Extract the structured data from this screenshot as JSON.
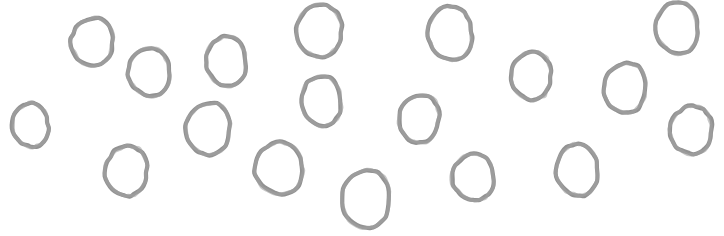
{
  "canvas": {
    "width": 724,
    "height": 236,
    "background_color": "#ffffff",
    "title": "hand-drawn-ellipses-sketch"
  },
  "style": {
    "stroke_color": "#8c8c8c",
    "stroke_color_light": "#a3a3a3",
    "stroke_width": 4.2,
    "fill": "none"
  },
  "shapes": {
    "kind": "ellipse",
    "count": 18,
    "items": [
      {
        "id": "ellipse-1",
        "cx": 32,
        "cy": 125,
        "rx": 18,
        "ry": 22,
        "rot": -8,
        "seed": 11
      },
      {
        "id": "ellipse-2",
        "cx": 94,
        "cy": 42,
        "rx": 21,
        "ry": 24,
        "rot": 6,
        "seed": 23
      },
      {
        "id": "ellipse-3",
        "cx": 151,
        "cy": 72,
        "rx": 21,
        "ry": 24,
        "rot": -5,
        "seed": 37
      },
      {
        "id": "ellipse-4",
        "cx": 128,
        "cy": 171,
        "rx": 21,
        "ry": 25,
        "rot": 4,
        "seed": 41
      },
      {
        "id": "ellipse-5",
        "cx": 228,
        "cy": 61,
        "rx": 20,
        "ry": 25,
        "rot": -3,
        "seed": 53
      },
      {
        "id": "ellipse-6",
        "cx": 210,
        "cy": 129,
        "rx": 22,
        "ry": 26,
        "rot": 7,
        "seed": 67
      },
      {
        "id": "ellipse-7",
        "cx": 281,
        "cy": 168,
        "rx": 24,
        "ry": 26,
        "rot": -10,
        "seed": 71
      },
      {
        "id": "ellipse-8",
        "cx": 321,
        "cy": 31,
        "rx": 23,
        "ry": 26,
        "rot": 5,
        "seed": 83
      },
      {
        "id": "ellipse-9",
        "cx": 323,
        "cy": 101,
        "rx": 20,
        "ry": 25,
        "rot": -4,
        "seed": 97
      },
      {
        "id": "ellipse-10",
        "cx": 368,
        "cy": 199,
        "rx": 24,
        "ry": 29,
        "rot": 3,
        "seed": 103
      },
      {
        "id": "ellipse-11",
        "cx": 452,
        "cy": 33,
        "rx": 22,
        "ry": 27,
        "rot": -6,
        "seed": 113
      },
      {
        "id": "ellipse-12",
        "cx": 421,
        "cy": 119,
        "rx": 20,
        "ry": 24,
        "rot": 8,
        "seed": 127
      },
      {
        "id": "ellipse-13",
        "cx": 475,
        "cy": 177,
        "rx": 21,
        "ry": 23,
        "rot": -5,
        "seed": 139
      },
      {
        "id": "ellipse-14",
        "cx": 533,
        "cy": 76,
        "rx": 20,
        "ry": 24,
        "rot": 4,
        "seed": 149
      },
      {
        "id": "ellipse-15",
        "cx": 579,
        "cy": 170,
        "rx": 21,
        "ry": 26,
        "rot": -7,
        "seed": 157
      },
      {
        "id": "ellipse-16",
        "cx": 627,
        "cy": 88,
        "rx": 21,
        "ry": 25,
        "rot": 6,
        "seed": 167
      },
      {
        "id": "ellipse-17",
        "cx": 679,
        "cy": 28,
        "rx": 21,
        "ry": 26,
        "rot": -4,
        "seed": 179
      },
      {
        "id": "ellipse-18",
        "cx": 693,
        "cy": 130,
        "rx": 21,
        "ry": 24,
        "rot": 5,
        "seed": 191
      }
    ]
  }
}
